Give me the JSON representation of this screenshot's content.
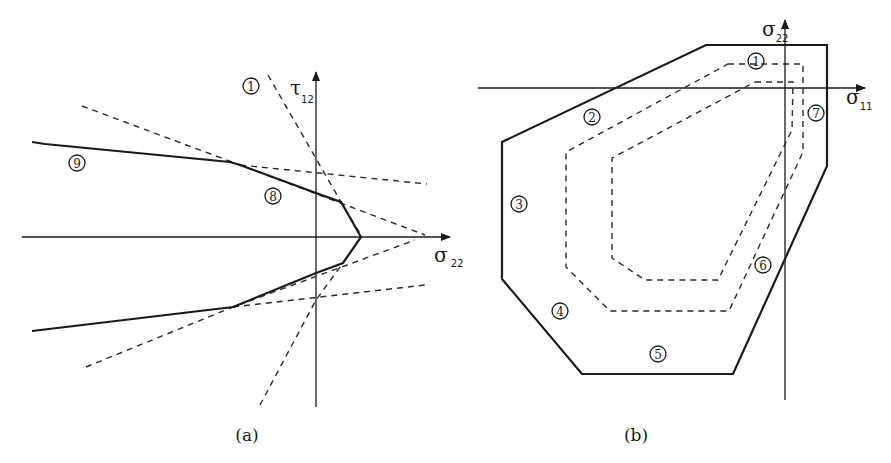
{
  "figure": {
    "panel_a": {
      "caption": "(a)",
      "x_axis": {
        "symbol": "σ",
        "subscript": "22"
      },
      "y_axis": {
        "symbol": "τ",
        "subscript": "12"
      },
      "labels": [
        {
          "id": "1",
          "glyph": "1",
          "x": 251,
          "y": 86
        },
        {
          "id": "8",
          "glyph": "8",
          "x": 273,
          "y": 196
        },
        {
          "id": "9",
          "glyph": "9",
          "x": 77,
          "y": 163
        }
      ],
      "failure_envelope": {
        "upper": [
          [
            32,
            142
          ],
          [
            45,
            144
          ],
          [
            230,
            162
          ],
          [
            240,
            165
          ],
          [
            316,
            193
          ],
          [
            341,
            202
          ],
          [
            361,
            237
          ]
        ],
        "lower": [
          [
            361,
            237
          ],
          [
            343,
            263
          ],
          [
            316,
            273
          ],
          [
            233,
            307
          ],
          [
            32,
            331
          ]
        ]
      },
      "dashed_lines": [
        [
          [
            268,
            75
          ],
          [
            341,
            202
          ],
          [
            362,
            237
          ]
        ],
        [
          [
            260,
            405
          ],
          [
            316,
            300
          ],
          [
            343,
            263
          ]
        ],
        [
          [
            82,
            106
          ],
          [
            240,
            165
          ],
          [
            425,
            235
          ]
        ],
        [
          [
            240,
            165
          ],
          [
            427,
            184
          ]
        ],
        [
          [
            86,
            367
          ],
          [
            233,
            307
          ],
          [
            415,
            240
          ]
        ],
        [
          [
            233,
            307
          ],
          [
            425,
            285
          ]
        ]
      ]
    },
    "panel_b": {
      "caption": "(b)",
      "x_axis": {
        "symbol": "σ",
        "subscript": "11"
      },
      "y_axis": {
        "symbol": "σ",
        "subscript": "22"
      },
      "labels": [
        {
          "id": "1",
          "glyph": "1",
          "x": 756,
          "y": 61
        },
        {
          "id": "2",
          "glyph": "2",
          "x": 592,
          "y": 117
        },
        {
          "id": "3",
          "glyph": "3",
          "x": 519,
          "y": 204
        },
        {
          "id": "4",
          "glyph": "4",
          "x": 560,
          "y": 311
        },
        {
          "id": "5",
          "glyph": "5",
          "x": 658,
          "y": 354
        },
        {
          "id": "6",
          "glyph": "6",
          "x": 763,
          "y": 265
        },
        {
          "id": "7",
          "glyph": "7",
          "x": 816,
          "y": 113
        }
      ],
      "outer_envelope": [
        [
          706,
          45
        ],
        [
          827,
          45
        ],
        [
          827,
          166
        ],
        [
          733,
          374
        ],
        [
          582,
          374
        ],
        [
          502,
          279
        ],
        [
          502,
          142
        ]
      ],
      "middle_dashed": [
        [
          728,
          64
        ],
        [
          803,
          64
        ],
        [
          803,
          152
        ],
        [
          729,
          311
        ],
        [
          610,
          311
        ],
        [
          566,
          267
        ],
        [
          566,
          152
        ]
      ],
      "inner_dashed": [
        [
          755,
          82
        ],
        [
          793,
          82
        ],
        [
          792,
          130
        ],
        [
          718,
          280
        ],
        [
          645,
          280
        ],
        [
          612,
          258
        ],
        [
          612,
          158
        ]
      ]
    }
  }
}
